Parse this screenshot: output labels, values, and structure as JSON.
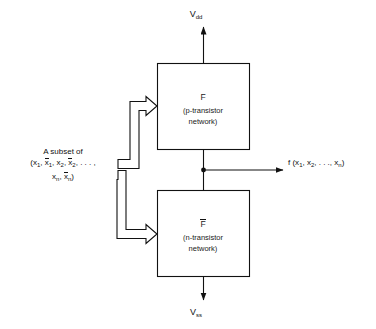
{
  "figure": {
    "type": "block-diagram",
    "background_color": "#ffffff",
    "line_color": "#111111"
  },
  "rails": {
    "top": {
      "name": "V",
      "subscript": "dd",
      "text": "Vdd",
      "direction": "up"
    },
    "bottom": {
      "name": "V",
      "subscript": "ss",
      "text": "Vss",
      "direction": "down"
    }
  },
  "blocks": [
    {
      "id": "p-network",
      "function_label": "F",
      "overbar": false,
      "description_line1": "(p-transistor",
      "description_line2": "network)"
    },
    {
      "id": "n-network",
      "function_label": "F",
      "overbar": true,
      "description_line1": "(n-transistor",
      "description_line2": "network)"
    }
  ],
  "input": {
    "line1": "A subset of",
    "line2_parts": [
      {
        "text": "(x",
        "sub": "1",
        "bar": false
      },
      {
        "text": ", ",
        "sub": "",
        "bar": false
      },
      {
        "text": "x",
        "sub": "1",
        "bar": true
      },
      {
        "text": ", x",
        "sub": "2",
        "bar": false
      },
      {
        "text": ", ",
        "sub": "",
        "bar": false
      },
      {
        "text": "x",
        "sub": "2",
        "bar": true
      },
      {
        "text": ", . . . ,",
        "sub": "",
        "bar": false
      }
    ],
    "line3_parts": [
      {
        "text": "x",
        "sub": "n",
        "bar": false
      },
      {
        "text": ", ",
        "sub": "",
        "bar": false
      },
      {
        "text": "x",
        "sub": "n",
        "bar": true
      },
      {
        "text": ")",
        "sub": "",
        "bar": false
      }
    ],
    "plain_line2": "(x1, x̄1, x2, x̄2, . . . ,",
    "plain_line3": "xn, x̄n)"
  },
  "output": {
    "function": "f",
    "args": "(x1, x2, . . ., xn)",
    "plain": "f (x1, x2, . . ., xn)"
  }
}
